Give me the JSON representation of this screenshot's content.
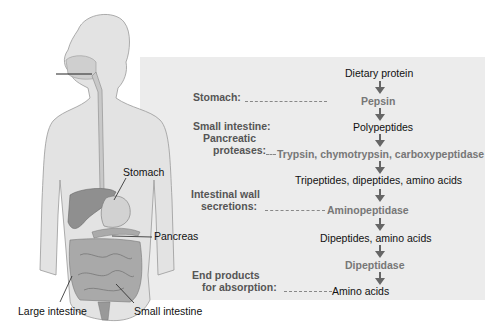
{
  "diagram": {
    "body_labels": {
      "stomach": "Stomach",
      "pancreas": "Pancreas",
      "large_intestine": "Large intestine",
      "small_intestine": "Small intestine"
    },
    "site_labels": {
      "stomach": "Stomach:",
      "small_intestine": "Small intestine:",
      "pancreatic": "Pancreatic",
      "proteases": "proteases:",
      "intestinal_wall": "Intestinal wall",
      "secretions": "secretions:",
      "end_products": "End products",
      "for_absorption": "for absorption:"
    },
    "substances": {
      "dietary_protein": "Dietary protein",
      "polypeptides": "Polypeptides",
      "tripeptides": "Tripeptides, dipeptides, amino acids",
      "dipeptides": "Dipeptides, amino acids",
      "amino_acids": "Amino acids"
    },
    "enzymes": {
      "pepsin": "Pepsin",
      "pancreatic": "Trypsin, chymotrypsin, carboxypeptidase",
      "aminopeptidase": "Aminopeptidase",
      "dipeptidase": "Dipeptidase"
    },
    "colors": {
      "panel": "#ececec",
      "enzyme_text": "#777777",
      "label_text": "#555555",
      "body_fill": "#e3e3e3",
      "organ_fill": "#9a9a9a"
    }
  }
}
